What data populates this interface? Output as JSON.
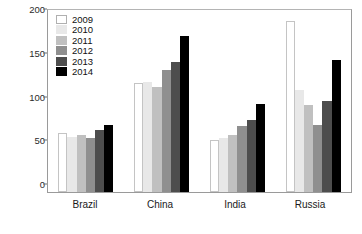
{
  "chart_data": {
    "type": "bar",
    "title": "",
    "subtitle": "",
    "xlabel": "",
    "ylabel": "",
    "categories": [
      "Brazil",
      "China",
      "India",
      "Russia"
    ],
    "ylim": [
      0,
      210
    ],
    "yticks": [
      0,
      50,
      100,
      150,
      200
    ],
    "ytick_labels": [
      "0",
      "50",
      "100",
      "150",
      "200"
    ],
    "grid": false,
    "legend_position": "top-left",
    "series": [
      {
        "name": "2009",
        "color": "#ffffff",
        "values": [
          68,
          126,
          60,
          197
        ]
      },
      {
        "name": "2010",
        "color": "#e8e8e8",
        "values": [
          63,
          127,
          62,
          118
        ]
      },
      {
        "name": "2011",
        "color": "#c0c0c0",
        "values": [
          66,
          121,
          66,
          100
        ]
      },
      {
        "name": "2012",
        "color": "#8f8f8f",
        "values": [
          62,
          141,
          76,
          77
        ]
      },
      {
        "name": "2013",
        "color": "#4d4d4d",
        "values": [
          71,
          150,
          83,
          105
        ]
      },
      {
        "name": "2014",
        "color": "#000000",
        "values": [
          77,
          180,
          102,
          152
        ]
      }
    ]
  },
  "axis": {
    "tick_0": "0",
    "tick_50": "50",
    "tick_100": "100",
    "tick_150": "150",
    "tick_200": "200"
  },
  "categories": {
    "c0": "Brazil",
    "c1": "China",
    "c2": "India",
    "c3": "Russia"
  },
  "legend": {
    "y0": "2009",
    "y1": "2010",
    "y2": "2011",
    "y3": "2012",
    "y4": "2013",
    "y5": "2014"
  }
}
